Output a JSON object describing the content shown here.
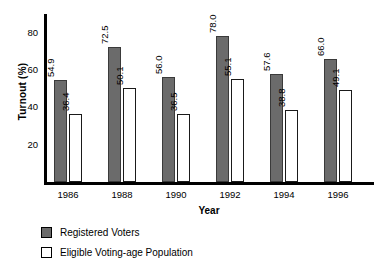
{
  "chart_data": {
    "type": "bar",
    "title": "",
    "xlabel": "Year",
    "ylabel": "Turnout (%)",
    "categories": [
      "1986",
      "1988",
      "1990",
      "1992",
      "1994",
      "1996"
    ],
    "yticks": [
      "20",
      "40",
      "60",
      "80"
    ],
    "ytick_values": [
      20,
      40,
      60,
      80
    ],
    "ylim": [
      0,
      90
    ],
    "grid": false,
    "legend_position": "bottom-left",
    "series": [
      {
        "name": "Registered Voters",
        "color": "#6b6b6b",
        "values": [
          54.9,
          72.5,
          56.0,
          78.0,
          57.6,
          66.0
        ],
        "labels": [
          "54.9",
          "72.5",
          "56.0",
          "78.0",
          "57.6",
          "66.0"
        ]
      },
      {
        "name": "Eligible Voting-age Population",
        "color": "#ffffff",
        "values": [
          36.4,
          50.1,
          36.5,
          55.1,
          38.8,
          49.1
        ],
        "labels": [
          "36.4",
          "50.1",
          "36.5",
          "55.1",
          "38.8",
          "49.1"
        ]
      }
    ]
  },
  "legend": {
    "items": [
      {
        "label": "Registered Voters",
        "swatch": "registered"
      },
      {
        "label": "Eligible Voting-age Population",
        "swatch": "eligible"
      }
    ]
  }
}
